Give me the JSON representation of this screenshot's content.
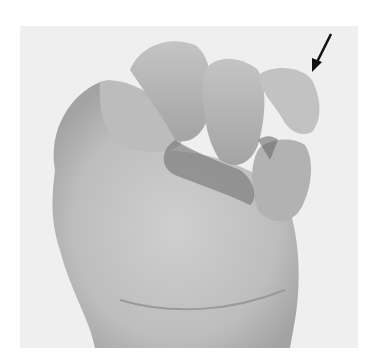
{
  "figure": {
    "colors": {
      "page_bg": "#ffffff",
      "photo_bg": "#efefef",
      "skin_light": "#c9c9c9",
      "skin_mid": "#b3b3b3",
      "skin_shadow": "#8a8a8a",
      "skin_dark": "#5e5e5e",
      "arrow": "#111111"
    },
    "annotation": {
      "type": "arrow",
      "points_to": "little-finger",
      "tail": [
        331,
        34
      ],
      "tip": [
        313,
        70
      ]
    }
  }
}
